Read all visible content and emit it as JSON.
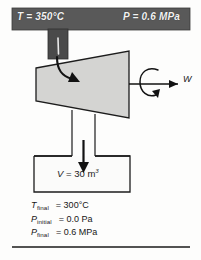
{
  "figure": {
    "inlet_band": {
      "temperature_label": "T = 350°C",
      "pressure_label": "P = 0.6 MPa",
      "band_color": "#595959",
      "text_color": "#f2f2f2"
    },
    "turbine": {
      "name": "turbine",
      "fill_color": "#d4d4d2",
      "stroke_color": "#1c1c1c"
    },
    "shaft": {
      "work_label": "W",
      "rotation_icon": "rotation-arrow-icon"
    },
    "inlet_pipe": {
      "flow_icon": "curved-flow-arrow-icon",
      "color": "#4a4a4a"
    },
    "outlet_pipe": {
      "flow_icon": "down-arrow-icon"
    },
    "tank": {
      "volume_symbol": "V",
      "volume_equals": "=",
      "volume_value": "30",
      "volume_unit": "m",
      "volume_unit_exponent": "3",
      "volume_label": "V = 30 m³",
      "fill_color": "#fbfbfa",
      "stroke_color": "#1c1c1c"
    },
    "legend": {
      "rows": [
        {
          "symbol": "T",
          "subscript": "final",
          "value": "= 300°C",
          "full": "T_final = 300°C"
        },
        {
          "symbol": "P",
          "subscript": "initial",
          "value": "= 0.0 Pa",
          "full": "P_initial = 0.0 Pa"
        },
        {
          "symbol": "P",
          "subscript": "final",
          "value": "= 0.6 MPa",
          "full": "P_final = 0.6 MPa"
        }
      ]
    },
    "rule": {
      "name": "bottom-divider"
    }
  }
}
